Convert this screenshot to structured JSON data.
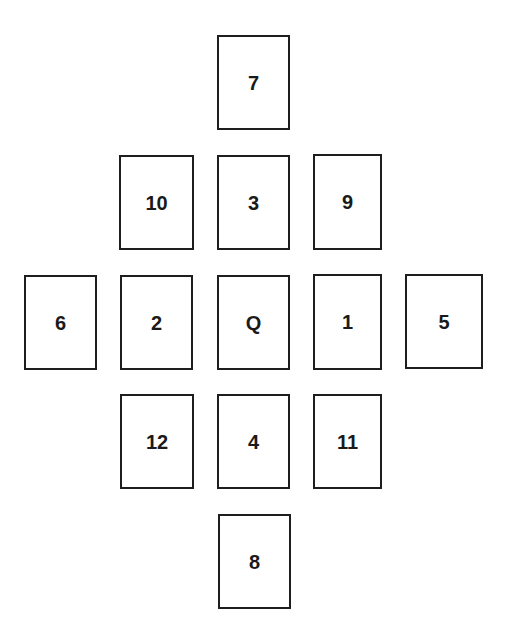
{
  "diagram": {
    "type": "card-spread-layout",
    "cards": [
      {
        "id": "c7",
        "label": "7",
        "row": 1,
        "column": 3
      },
      {
        "id": "c10",
        "label": "10",
        "row": 2,
        "column": 2
      },
      {
        "id": "c3",
        "label": "3",
        "row": 2,
        "column": 3
      },
      {
        "id": "c9",
        "label": "9",
        "row": 2,
        "column": 4
      },
      {
        "id": "c6",
        "label": "6",
        "row": 3,
        "column": 1
      },
      {
        "id": "c2",
        "label": "2",
        "row": 3,
        "column": 2
      },
      {
        "id": "cQ",
        "label": "Q",
        "row": 3,
        "column": 3
      },
      {
        "id": "c1",
        "label": "1",
        "row": 3,
        "column": 4
      },
      {
        "id": "c5",
        "label": "5",
        "row": 3,
        "column": 5
      },
      {
        "id": "c12",
        "label": "12",
        "row": 4,
        "column": 2
      },
      {
        "id": "c4",
        "label": "4",
        "row": 4,
        "column": 3
      },
      {
        "id": "c11",
        "label": "11",
        "row": 4,
        "column": 4
      },
      {
        "id": "c8",
        "label": "8",
        "row": 5,
        "column": 3
      }
    ],
    "colors": {
      "card_border": "#1e1e1e",
      "card_fill": "#ffffff",
      "label_text": "#1a1a1a",
      "background": "#ffffff"
    }
  }
}
